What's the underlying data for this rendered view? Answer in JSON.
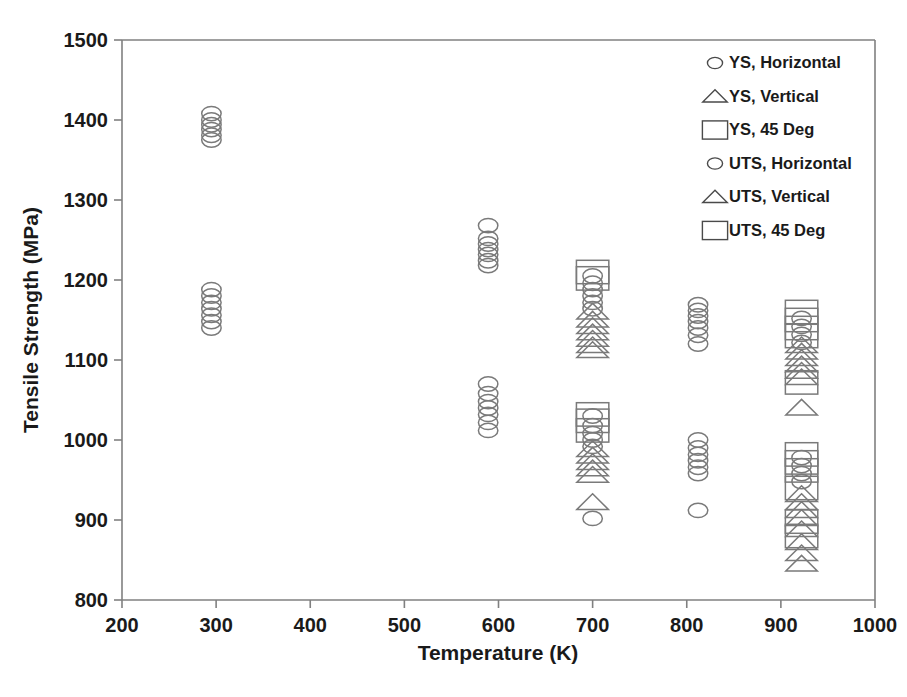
{
  "chart_data": {
    "type": "scatter",
    "title": "",
    "xlabel": "Temperature (K)",
    "ylabel": "Tensile Strength (MPa)",
    "xlim": [
      200,
      1000
    ],
    "ylim": [
      800,
      1500
    ],
    "xticks": [
      200,
      300,
      400,
      500,
      600,
      700,
      800,
      900,
      1000
    ],
    "yticks": [
      800,
      900,
      1000,
      1100,
      1200,
      1300,
      1400,
      1500
    ],
    "grid": false,
    "legend_position": "top-right",
    "legend": [
      {
        "label": "YS, Horizontal",
        "marker": "circle"
      },
      {
        "label": "YS, Vertical",
        "marker": "triangle"
      },
      {
        "label": "YS, 45 Deg",
        "marker": "square"
      },
      {
        "label": "UTS, Horizontal",
        "marker": "circle"
      },
      {
        "label": "UTS, Vertical",
        "marker": "triangle"
      },
      {
        "label": "UTS, 45 Deg",
        "marker": "square"
      }
    ],
    "series": [
      {
        "name": "UTS, Horizontal",
        "marker": "circle",
        "points": [
          [
            295,
            1408
          ],
          [
            295,
            1400
          ],
          [
            295,
            1394
          ],
          [
            295,
            1388
          ],
          [
            295,
            1381
          ],
          [
            295,
            1375
          ],
          [
            589,
            1268
          ],
          [
            589,
            1252
          ],
          [
            589,
            1245
          ],
          [
            589,
            1238
          ],
          [
            589,
            1232
          ],
          [
            589,
            1224
          ],
          [
            589,
            1218
          ],
          [
            700,
            1205
          ],
          [
            700,
            1196
          ],
          [
            700,
            1188
          ],
          [
            700,
            1180
          ],
          [
            700,
            1172
          ],
          [
            700,
            1164
          ],
          [
            812,
            1169
          ],
          [
            812,
            1162
          ],
          [
            812,
            1155
          ],
          [
            812,
            1148
          ],
          [
            812,
            1140
          ],
          [
            812,
            1131
          ],
          [
            812,
            1120
          ],
          [
            922,
            1152
          ],
          [
            922,
            1142
          ],
          [
            922,
            1132
          ],
          [
            922,
            1122
          ]
        ]
      },
      {
        "name": "UTS, Vertical",
        "marker": "triangle",
        "points": [
          [
            700,
            1160
          ],
          [
            700,
            1150
          ],
          [
            700,
            1142
          ],
          [
            700,
            1134
          ],
          [
            700,
            1126
          ],
          [
            700,
            1118
          ],
          [
            700,
            1112
          ],
          [
            922,
            1118
          ],
          [
            922,
            1110
          ],
          [
            922,
            1102
          ],
          [
            922,
            1094
          ],
          [
            922,
            1086
          ],
          [
            922,
            1078
          ],
          [
            922,
            1040
          ]
        ]
      },
      {
        "name": "UTS, 45 Deg",
        "marker": "square",
        "points": [
          [
            700,
            1210
          ],
          [
            700,
            1202
          ],
          [
            922,
            1160
          ],
          [
            922,
            1150
          ],
          [
            922,
            1140
          ],
          [
            922,
            1130
          ],
          [
            922,
            1072
          ]
        ]
      },
      {
        "name": "YS, Horizontal",
        "marker": "circle",
        "points": [
          [
            295,
            1188
          ],
          [
            295,
            1180
          ],
          [
            295,
            1172
          ],
          [
            295,
            1164
          ],
          [
            295,
            1156
          ],
          [
            295,
            1148
          ],
          [
            295,
            1140
          ],
          [
            589,
            1070
          ],
          [
            589,
            1058
          ],
          [
            589,
            1048
          ],
          [
            589,
            1040
          ],
          [
            589,
            1032
          ],
          [
            589,
            1022
          ],
          [
            589,
            1012
          ],
          [
            700,
            1030
          ],
          [
            700,
            1018
          ],
          [
            700,
            1008
          ],
          [
            700,
            1000
          ],
          [
            700,
            992
          ],
          [
            700,
            902
          ],
          [
            812,
            1000
          ],
          [
            812,
            990
          ],
          [
            812,
            982
          ],
          [
            812,
            974
          ],
          [
            812,
            966
          ],
          [
            812,
            958
          ],
          [
            812,
            912
          ],
          [
            922,
            978
          ],
          [
            922,
            968
          ],
          [
            922,
            958
          ],
          [
            922,
            948
          ]
        ]
      },
      {
        "name": "YS, Vertical",
        "marker": "triangle",
        "points": [
          [
            700,
            988
          ],
          [
            700,
            980
          ],
          [
            700,
            972
          ],
          [
            700,
            964
          ],
          [
            700,
            956
          ],
          [
            700,
            922
          ],
          [
            922,
            932
          ],
          [
            922,
            922
          ],
          [
            922,
            912
          ],
          [
            922,
            902
          ],
          [
            922,
            888
          ],
          [
            922,
            872
          ],
          [
            922,
            858
          ],
          [
            922,
            845
          ]
        ]
      },
      {
        "name": "YS, 45 Deg",
        "marker": "square",
        "points": [
          [
            700,
            1032
          ],
          [
            700,
            1024
          ],
          [
            700,
            1012
          ],
          [
            922,
            982
          ],
          [
            922,
            972
          ],
          [
            922,
            962
          ],
          [
            922,
            940
          ],
          [
            922,
            898
          ],
          [
            922,
            880
          ]
        ]
      }
    ]
  }
}
